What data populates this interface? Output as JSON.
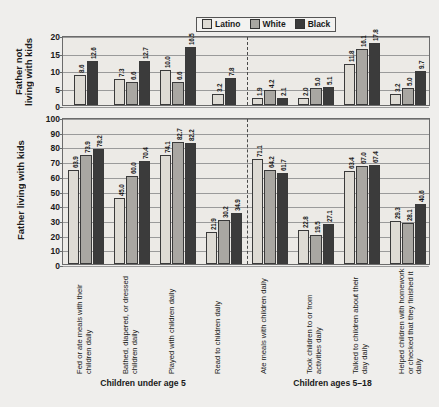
{
  "legend": {
    "items": [
      {
        "label": "Latino",
        "color": "#dedbd4"
      },
      {
        "label": "White",
        "color": "#a9a7a2"
      },
      {
        "label": "Black",
        "color": "#3b3b3b"
      }
    ]
  },
  "panels": {
    "top": {
      "ytitle": "Father not living with kids",
      "yticks": [
        "0",
        "5",
        "10",
        "15",
        "20"
      ]
    },
    "bottom": {
      "ytitle": "Father living with kids",
      "yticks": [
        "0",
        "10",
        "20",
        "30",
        "40",
        "50",
        "60",
        "70",
        "80",
        "90",
        "100"
      ]
    }
  },
  "group_titles": [
    "Children under age 5",
    "Children ages 5–18"
  ],
  "chart_data": [
    {
      "type": "bar",
      "title": "Father not living with kids",
      "panel": "top",
      "xlabel": "",
      "ylabel": "Father not living with kids",
      "ylim": [
        0,
        20
      ],
      "yticks": [
        0,
        5,
        10,
        15,
        20
      ],
      "grid": true,
      "legend_position": "top-center",
      "section_divider_after_category": 4,
      "sections": [
        "Children under age 5",
        "Children ages 5–18"
      ],
      "categories": [
        "Fed or ate meals with their children daily",
        "Bathed, diapered, or dressed children daily",
        "Played with children daily",
        "Read to children daily",
        "Ate meals with children daily",
        "Took children to or from activities daily",
        "Talked to children about their day daily",
        "Helped children with homework or checked that they finished it daily"
      ],
      "series": [
        {
          "name": "Latino",
          "values": [
            8.6,
            7.3,
            10.0,
            3.2,
            1.9,
            2.0,
            11.8,
            3.2
          ]
        },
        {
          "name": "White",
          "values": [
            null,
            6.6,
            6.6,
            null,
            4.2,
            5.0,
            16.1,
            5.0
          ]
        },
        {
          "name": "Black",
          "values": [
            12.6,
            12.7,
            16.5,
            7.8,
            2.1,
            5.1,
            17.8,
            9.7
          ]
        }
      ]
    },
    {
      "type": "bar",
      "title": "Father living with kids",
      "panel": "bottom",
      "xlabel": "",
      "ylabel": "Father living with kids",
      "ylim": [
        0,
        100
      ],
      "yticks": [
        0,
        10,
        20,
        30,
        40,
        50,
        60,
        70,
        80,
        90,
        100
      ],
      "grid": true,
      "section_divider_after_category": 4,
      "sections": [
        "Children under age 5",
        "Children ages 5–18"
      ],
      "categories": [
        "Fed or ate meals with their children daily",
        "Bathed, diapered, or dressed children daily",
        "Played with children daily",
        "Read to children daily",
        "Ate meals with children daily",
        "Took children to or from activities daily",
        "Talked to children about their day daily",
        "Helped children with homework or checked that they finished it daily"
      ],
      "series": [
        {
          "name": "Latino",
          "values": [
            63.9,
            45.0,
            74.1,
            21.9,
            71.1,
            22.8,
            63.4,
            29.3
          ]
        },
        {
          "name": "White",
          "values": [
            73.9,
            60.0,
            82.7,
            30.2,
            64.2,
            19.5,
            67.0,
            28.1
          ]
        },
        {
          "name": "Black",
          "values": [
            78.2,
            70.4,
            82.2,
            34.9,
            61.7,
            27.1,
            67.4,
            40.6
          ]
        }
      ]
    }
  ]
}
